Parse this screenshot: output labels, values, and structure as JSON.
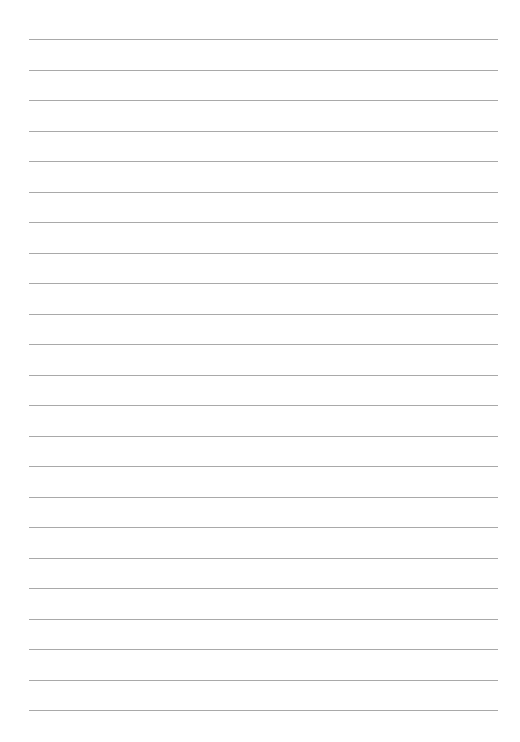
{
  "page": {
    "type": "lined-paper",
    "background_color": "#ffffff",
    "line_color": "#a9a9a9",
    "line_count": 23,
    "line_left": 29,
    "line_right": 498,
    "first_line_y": 39,
    "line_spacing": 30.5,
    "lines": []
  }
}
